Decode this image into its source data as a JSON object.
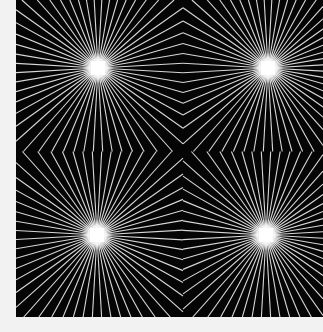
{
  "image": {
    "subject": "op-art radiating line pattern",
    "background_color": "#f2f2f2",
    "panel_color": "#050505",
    "line_color": "#d8d8d8",
    "glow_color": "#ffffff",
    "panel": {
      "x": 16,
      "y": 0,
      "width": 307,
      "height": 317
    },
    "centers": [
      {
        "name": "top-left",
        "x": 82,
        "y": 68
      },
      {
        "name": "top-right",
        "x": 252,
        "y": 68
      },
      {
        "name": "bottom-left",
        "x": 81,
        "y": 235
      },
      {
        "name": "bottom-right",
        "x": 250,
        "y": 235
      }
    ],
    "rays_per_center": 56
  }
}
